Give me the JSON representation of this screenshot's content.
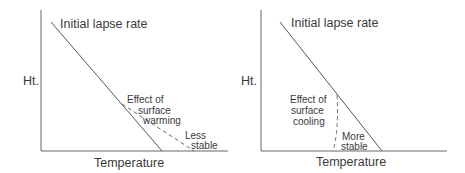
{
  "panels": [
    {
      "id": "warming",
      "title": "Initial lapse rate",
      "ylabel": "Ht.",
      "xlabel": "Temperature",
      "effect_lines": [
        "Effect of",
        "surface",
        "warming"
      ],
      "stability_lines": [
        "Less",
        "stable"
      ]
    },
    {
      "id": "cooling",
      "title": "Initial lapse rate",
      "ylabel": "Ht.",
      "xlabel": "Temperature",
      "effect_lines": [
        "Effect of",
        "surface",
        "cooling"
      ],
      "stability_lines": [
        "More",
        "stable"
      ]
    }
  ],
  "colors": {
    "axis": "#555555",
    "line": "#555555",
    "text": "#3a3a3a"
  }
}
